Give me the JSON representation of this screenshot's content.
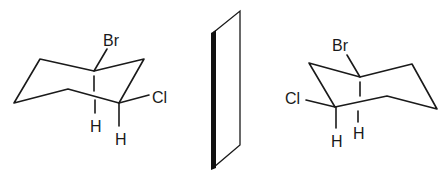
{
  "colors": {
    "ink": "#1a1a1a",
    "background": "#ffffff"
  },
  "left_molecule": {
    "labels": {
      "top": "Br",
      "right": "Cl",
      "h1": "H",
      "h2": "H"
    }
  },
  "mirror": {
    "name": "mirror-plane"
  },
  "right_molecule": {
    "labels": {
      "top": "Br",
      "left": "Cl",
      "h1": "H",
      "h2": "H"
    }
  }
}
